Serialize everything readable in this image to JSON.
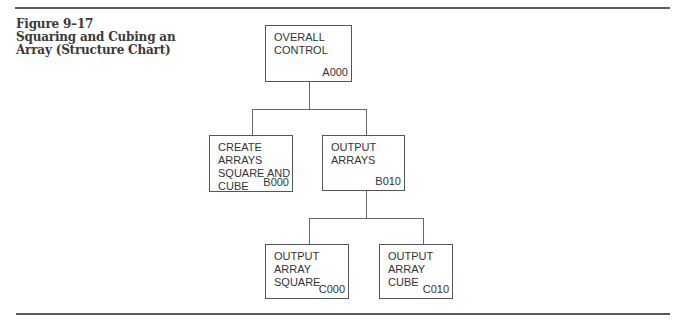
{
  "figure": {
    "number": "Figure 9–17",
    "title_line1": "Squaring and Cubing an",
    "title_line2": "Array (Structure Chart)"
  },
  "nodes": {
    "a000": {
      "lines": [
        "OVERALL",
        "CONTROL"
      ],
      "code": "A000"
    },
    "b000": {
      "lines": [
        "CREATE",
        "ARRAYS",
        "SQUARE AND",
        "CUBE"
      ],
      "code": "B000"
    },
    "b010": {
      "lines": [
        "OUTPUT",
        "ARRAYS"
      ],
      "code": "B010"
    },
    "c000": {
      "lines": [
        "OUTPUT",
        "ARRAY",
        "SQUARE"
      ],
      "code": "C000"
    },
    "c010": {
      "lines": [
        "OUTPUT",
        "ARRAY",
        "CUBE"
      ],
      "code": "C010"
    }
  },
  "edges": [
    {
      "from": "A000",
      "to": "B000"
    },
    {
      "from": "A000",
      "to": "B010"
    },
    {
      "from": "B010",
      "to": "C000"
    },
    {
      "from": "B010",
      "to": "C010"
    }
  ]
}
